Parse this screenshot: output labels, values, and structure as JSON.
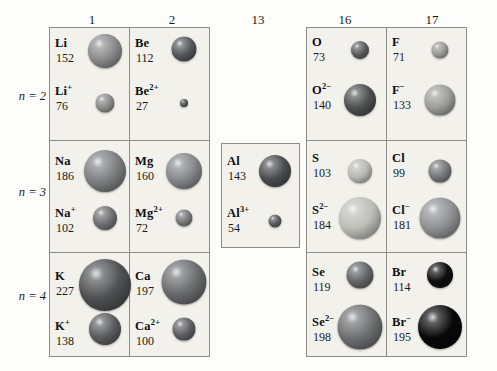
{
  "figure": {
    "type": "diagram",
    "units": "pm",
    "background_color": "#f2f1ec",
    "border_color": "#8c8c88"
  },
  "column_headers": [
    {
      "label": "1",
      "x": 92
    },
    {
      "label": "2",
      "x": 172
    },
    {
      "label": "13",
      "x": 258
    },
    {
      "label": "16",
      "x": 345
    },
    {
      "label": "17",
      "x": 432
    }
  ],
  "row_labels": [
    {
      "label": "n = 2",
      "y": 96
    },
    {
      "label": "n = 3",
      "y": 192
    },
    {
      "label": "n = 4",
      "y": 296
    }
  ],
  "chart_data": {
    "type": "table",
    "categories": [
      "1",
      "2",
      "13",
      "16",
      "17"
    ],
    "rows": [
      "n = 2",
      "n = 3",
      "n = 4"
    ],
    "species": [
      {
        "symbol": "Li",
        "charge": "",
        "radius": 152,
        "group": "1",
        "shell": "n = 2",
        "kind": "atom",
        "color": "#8b8b8b"
      },
      {
        "symbol": "Li",
        "charge": "+",
        "radius": 76,
        "group": "1",
        "shell": "n = 2",
        "kind": "cation",
        "color": "#8b8b8b"
      },
      {
        "symbol": "Be",
        "charge": "",
        "radius": 112,
        "group": "2",
        "shell": "n = 2",
        "kind": "atom",
        "color": "#53565a"
      },
      {
        "symbol": "Be",
        "charge": "2+",
        "radius": 27,
        "group": "2",
        "shell": "n = 2",
        "kind": "cation",
        "color": "#53565a"
      },
      {
        "symbol": "O",
        "charge": "",
        "radius": 73,
        "group": "16",
        "shell": "n = 2",
        "kind": "atom",
        "color": "#5b5d5c"
      },
      {
        "symbol": "O",
        "charge": "2-",
        "radius": 140,
        "group": "16",
        "shell": "n = 2",
        "kind": "anion",
        "color": "#4d4f4e"
      },
      {
        "symbol": "F",
        "charge": "",
        "radius": 71,
        "group": "17",
        "shell": "n = 2",
        "kind": "atom",
        "color": "#9a9a98"
      },
      {
        "symbol": "F",
        "charge": "-",
        "radius": 133,
        "group": "17",
        "shell": "n = 2",
        "kind": "anion",
        "color": "#9c9c9a"
      },
      {
        "symbol": "Na",
        "charge": "",
        "radius": 186,
        "group": "1",
        "shell": "n = 3",
        "kind": "atom",
        "color": "#7c7e80"
      },
      {
        "symbol": "Na",
        "charge": "+",
        "radius": 102,
        "group": "1",
        "shell": "n = 3",
        "kind": "cation",
        "color": "#6e7072"
      },
      {
        "symbol": "Mg",
        "charge": "",
        "radius": 160,
        "group": "2",
        "shell": "n = 3",
        "kind": "atom",
        "color": "#85878a"
      },
      {
        "symbol": "Mg",
        "charge": "2+",
        "radius": 72,
        "group": "2",
        "shell": "n = 3",
        "kind": "cation",
        "color": "#76787a"
      },
      {
        "symbol": "Al",
        "charge": "",
        "radius": 143,
        "group": "13",
        "shell": "n = 3",
        "kind": "atom",
        "color": "#4a4c4e"
      },
      {
        "symbol": "Al",
        "charge": "3+",
        "radius": 54,
        "group": "13",
        "shell": "n = 3",
        "kind": "cation",
        "color": "#57595b"
      },
      {
        "symbol": "S",
        "charge": "",
        "radius": 103,
        "group": "16",
        "shell": "n = 3",
        "kind": "atom",
        "color": "#b9b9b4"
      },
      {
        "symbol": "S",
        "charge": "2-",
        "radius": 184,
        "group": "16",
        "shell": "n = 3",
        "kind": "anion",
        "color": "#bdbdb8"
      },
      {
        "symbol": "Cl",
        "charge": "",
        "radius": 99,
        "group": "17",
        "shell": "n = 3",
        "kind": "atom",
        "color": "#76787a"
      },
      {
        "symbol": "Cl",
        "charge": "-",
        "radius": 181,
        "group": "17",
        "shell": "n = 3",
        "kind": "anion",
        "color": "#8e9092"
      },
      {
        "symbol": "K",
        "charge": "",
        "radius": 227,
        "group": "1",
        "shell": "n = 4",
        "kind": "atom",
        "color": "#4e5052"
      },
      {
        "symbol": "K",
        "charge": "+",
        "radius": 138,
        "group": "1",
        "shell": "n = 4",
        "kind": "cation",
        "color": "#5a5c5e"
      },
      {
        "symbol": "Ca",
        "charge": "",
        "radius": 197,
        "group": "2",
        "shell": "n = 4",
        "kind": "atom",
        "color": "#6a6c6e"
      },
      {
        "symbol": "Ca",
        "charge": "2+",
        "radius": 100,
        "group": "2",
        "shell": "n = 4",
        "kind": "cation",
        "color": "#5e6062"
      },
      {
        "symbol": "Se",
        "charge": "",
        "radius": 119,
        "group": "16",
        "shell": "n = 4",
        "kind": "atom",
        "color": "#636567"
      },
      {
        "symbol": "Se",
        "charge": "2-",
        "radius": 198,
        "group": "16",
        "shell": "n = 4",
        "kind": "anion",
        "color": "#6d6f71"
      },
      {
        "symbol": "Br",
        "charge": "",
        "radius": 114,
        "group": "17",
        "shell": "n = 4",
        "kind": "atom",
        "color": "#0d0d0d"
      },
      {
        "symbol": "Br",
        "charge": "-",
        "radius": 195,
        "group": "17",
        "shell": "n = 4",
        "kind": "anion",
        "color": "#080808"
      }
    ]
  },
  "cells": [
    {
      "id": "li",
      "sym": "Li",
      "sup": "",
      "val": "152",
      "x": 49,
      "y": 27,
      "w": 80,
      "h": 48,
      "cx": 105,
      "cy": 51,
      "d": 34,
      "color": "#8b8b8b"
    },
    {
      "id": "li-p",
      "sym": "Li",
      "sup": "+",
      "val": "76",
      "x": 49,
      "y": 75,
      "w": 80,
      "h": 48,
      "cx": 105,
      "cy": 103,
      "d": 19,
      "color": "#8b8b8b"
    },
    {
      "id": "be",
      "sym": "Be",
      "sup": "",
      "val": "112",
      "x": 129,
      "y": 27,
      "w": 80,
      "h": 48,
      "cx": 184,
      "cy": 49,
      "d": 25,
      "color": "#53565a"
    },
    {
      "id": "be-p",
      "sym": "Be",
      "sup": "2+",
      "val": "27",
      "x": 129,
      "y": 75,
      "w": 80,
      "h": 48,
      "cx": 184,
      "cy": 103,
      "d": 8,
      "color": "#53565a"
    },
    {
      "id": "o",
      "sym": "O",
      "sup": "",
      "val": "73",
      "x": 306,
      "y": 27,
      "w": 80,
      "h": 45,
      "cx": 360,
      "cy": 50,
      "d": 18,
      "color": "#5b5d5c"
    },
    {
      "id": "o-m",
      "sym": "O",
      "sup": "2-",
      "val": "140",
      "x": 306,
      "y": 72,
      "w": 80,
      "h": 51,
      "cx": 360,
      "cy": 100,
      "d": 32,
      "color": "#4d4f4e"
    },
    {
      "id": "f",
      "sym": "F",
      "sup": "",
      "val": "71",
      "x": 386,
      "y": 27,
      "w": 80,
      "h": 45,
      "cx": 440,
      "cy": 50,
      "d": 17,
      "color": "#9a9a98"
    },
    {
      "id": "f-m",
      "sym": "F",
      "sup": "-",
      "val": "133",
      "x": 386,
      "y": 72,
      "w": 80,
      "h": 51,
      "cx": 440,
      "cy": 100,
      "d": 31,
      "color": "#9c9c9a"
    },
    {
      "id": "na",
      "sym": "Na",
      "sup": "",
      "val": "186",
      "x": 49,
      "y": 143,
      "w": 80,
      "h": 52,
      "cx": 105,
      "cy": 171,
      "d": 42,
      "color": "#7c7e80"
    },
    {
      "id": "na-p",
      "sym": "Na",
      "sup": "+",
      "val": "102",
      "x": 49,
      "y": 195,
      "w": 80,
      "h": 52,
      "cx": 105,
      "cy": 218,
      "d": 24,
      "color": "#6e7072"
    },
    {
      "id": "mg",
      "sym": "Mg",
      "sup": "",
      "val": "160",
      "x": 129,
      "y": 143,
      "w": 80,
      "h": 52,
      "cx": 184,
      "cy": 171,
      "d": 36,
      "color": "#85878a"
    },
    {
      "id": "mg-p",
      "sym": "Mg",
      "sup": "2+",
      "val": "72",
      "x": 129,
      "y": 195,
      "w": 80,
      "h": 52,
      "cx": 184,
      "cy": 218,
      "d": 17,
      "color": "#76787a"
    },
    {
      "id": "al",
      "sym": "Al",
      "sup": "",
      "val": "143",
      "x": 221,
      "y": 143,
      "w": 78,
      "h": 52,
      "cx": 275,
      "cy": 171,
      "d": 32,
      "color": "#4a4c4e"
    },
    {
      "id": "al-p",
      "sym": "Al",
      "sup": "3+",
      "val": "54",
      "x": 221,
      "y": 195,
      "w": 78,
      "h": 52,
      "cx": 275,
      "cy": 221,
      "d": 13,
      "color": "#57595b"
    },
    {
      "id": "s",
      "sym": "S",
      "sup": "",
      "val": "103",
      "x": 306,
      "y": 143,
      "w": 80,
      "h": 46,
      "cx": 360,
      "cy": 171,
      "d": 24,
      "color": "#b9b9b4"
    },
    {
      "id": "s-m",
      "sym": "S",
      "sup": "2-",
      "val": "184",
      "x": 306,
      "y": 189,
      "w": 80,
      "h": 58,
      "cx": 360,
      "cy": 218,
      "d": 42,
      "color": "#bdbdb8"
    },
    {
      "id": "cl",
      "sym": "Cl",
      "sup": "",
      "val": "99",
      "x": 386,
      "y": 143,
      "w": 80,
      "h": 46,
      "cx": 440,
      "cy": 171,
      "d": 23,
      "color": "#76787a"
    },
    {
      "id": "cl-m",
      "sym": "Cl",
      "sup": "-",
      "val": "181",
      "x": 386,
      "y": 189,
      "w": 80,
      "h": 58,
      "cx": 440,
      "cy": 218,
      "d": 41,
      "color": "#8e9092"
    },
    {
      "id": "k",
      "sym": "K",
      "sup": "",
      "val": "227",
      "x": 49,
      "y": 256,
      "w": 80,
      "h": 55,
      "cx": 105,
      "cy": 285,
      "d": 52,
      "color": "#4e5052"
    },
    {
      "id": "k-p",
      "sym": "K",
      "sup": "+",
      "val": "138",
      "x": 49,
      "y": 311,
      "w": 80,
      "h": 45,
      "cx": 105,
      "cy": 329,
      "d": 32,
      "color": "#5a5c5e"
    },
    {
      "id": "ca",
      "sym": "Ca",
      "sup": "",
      "val": "197",
      "x": 129,
      "y": 256,
      "w": 80,
      "h": 55,
      "cx": 184,
      "cy": 282,
      "d": 45,
      "color": "#6a6c6e"
    },
    {
      "id": "ca-p",
      "sym": "Ca",
      "sup": "2+",
      "val": "100",
      "x": 129,
      "y": 311,
      "w": 80,
      "h": 45,
      "cx": 184,
      "cy": 329,
      "d": 23,
      "color": "#5e6062"
    },
    {
      "id": "se",
      "sym": "Se",
      "sup": "",
      "val": "119",
      "x": 306,
      "y": 256,
      "w": 80,
      "h": 48,
      "cx": 360,
      "cy": 275,
      "d": 27,
      "color": "#636567"
    },
    {
      "id": "se-m",
      "sym": "Se",
      "sup": "2-",
      "val": "198",
      "x": 306,
      "y": 304,
      "w": 80,
      "h": 52,
      "cx": 360,
      "cy": 327,
      "d": 45,
      "color": "#6d6f71"
    },
    {
      "id": "br",
      "sym": "Br",
      "sup": "",
      "val": "114",
      "x": 386,
      "y": 256,
      "w": 80,
      "h": 48,
      "cx": 440,
      "cy": 275,
      "d": 26,
      "color": "#0d0d0d"
    },
    {
      "id": "br-m",
      "sym": "Br",
      "sup": "-",
      "val": "195",
      "x": 386,
      "y": 304,
      "w": 80,
      "h": 52,
      "cx": 440,
      "cy": 327,
      "d": 44,
      "color": "#080808"
    }
  ],
  "blocks": [
    {
      "id": "left-block",
      "x": 49,
      "y": 27,
      "w": 161,
      "h": 330
    },
    {
      "id": "al-block",
      "x": 221,
      "y": 143,
      "w": 79,
      "h": 105
    },
    {
      "id": "right-block",
      "x": 306,
      "y": 27,
      "w": 161,
      "h": 330
    }
  ],
  "dividers": {
    "vertical": [
      {
        "id": "left-col-divider",
        "x": 129,
        "y": 27,
        "h": 330
      },
      {
        "id": "right-col-divider",
        "x": 386,
        "y": 27,
        "h": 330
      }
    ],
    "horizontal": [
      {
        "id": "left-n2-n3",
        "x": 49,
        "y": 140,
        "w": 161
      },
      {
        "id": "left-n3-n4",
        "x": 49,
        "y": 252,
        "w": 161
      },
      {
        "id": "right-n2-n3",
        "x": 306,
        "y": 140,
        "w": 161
      },
      {
        "id": "right-n3-n4",
        "x": 306,
        "y": 252,
        "w": 161
      }
    ]
  }
}
